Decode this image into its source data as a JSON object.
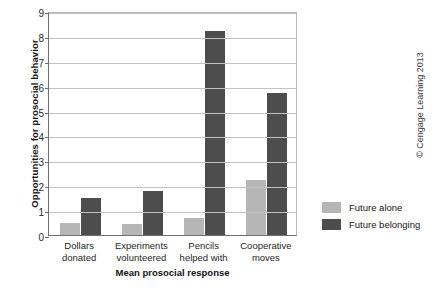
{
  "chart_data": {
    "type": "bar",
    "title": "",
    "xlabel": "Mean prosocial response",
    "ylabel": "Opportunities for prosocial behavior",
    "categories": [
      "Dollars\ndonated",
      "Experiments\nvolunteered",
      "Pencils\nhelped with",
      "Cooperative\nmoves"
    ],
    "category_lines": [
      [
        "Dollars",
        "donated"
      ],
      [
        "Experiments",
        "volunteered"
      ],
      [
        "Pencils",
        "helped with"
      ],
      [
        "Cooperative",
        "moves"
      ]
    ],
    "series": [
      {
        "name": "Future alone",
        "color": "#b6b6b6",
        "values": [
          0.5,
          0.45,
          0.7,
          2.2
        ]
      },
      {
        "name": "Future belonging",
        "color": "#4d4d4d",
        "values": [
          1.5,
          1.75,
          8.2,
          5.7
        ]
      }
    ],
    "ylim": [
      0,
      9
    ],
    "yticks": [
      0,
      1,
      2,
      3,
      4,
      5,
      6,
      7,
      8,
      9
    ],
    "ytick_labels": [
      "0",
      "1",
      "2",
      "3",
      "4",
      "5",
      "6",
      "7",
      "8",
      "9"
    ],
    "grid": true,
    "legend_position": "right"
  },
  "legend": {
    "entries": [
      {
        "label": "Future alone"
      },
      {
        "label": "Future belonging"
      }
    ]
  },
  "credit": {
    "text": "© Cengage Learning 2013"
  }
}
